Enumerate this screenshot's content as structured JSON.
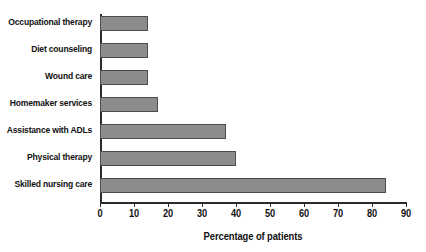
{
  "chart_data": {
    "type": "bar",
    "orientation": "horizontal",
    "title": "",
    "xlabel": "Percentage of patients",
    "ylabel": "",
    "xlim": [
      0,
      90
    ],
    "xticks": [
      0,
      10,
      20,
      30,
      40,
      50,
      60,
      70,
      80,
      90
    ],
    "grid": false,
    "legend": null,
    "categories": [
      "Occupational therapy",
      "Diet counseling",
      "Wound care",
      "Homemaker services",
      "Assistance with ADLs",
      "Physical therapy",
      "Skilled nursing care"
    ],
    "values": [
      14,
      14,
      14,
      17,
      37,
      40,
      84
    ],
    "colors": {
      "bar_fill": "#8c8c8c",
      "bar_border": "#4d4d4d",
      "axis": "#2b2b2b",
      "text": "#111111",
      "background": "#ffffff"
    }
  }
}
